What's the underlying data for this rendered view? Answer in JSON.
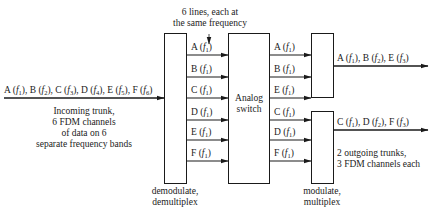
{
  "diagram": {
    "type": "block-diagram",
    "top_annotation": {
      "lines": [
        "6 lines, each at",
        "the same frequency"
      ]
    },
    "input": {
      "trunk_label": "A (f1), B (f2), C (f3), D (f4), E (f5), F (f6)",
      "channels": [
        {
          "name": "A",
          "freq": "1"
        },
        {
          "name": "B",
          "freq": "2"
        },
        {
          "name": "C",
          "freq": "3"
        },
        {
          "name": "D",
          "freq": "4"
        },
        {
          "name": "E",
          "freq": "5"
        },
        {
          "name": "F",
          "freq": "6"
        }
      ],
      "description": [
        "Incoming trunk,",
        "6 FDM channels",
        "of data on 6",
        "separate frequency bands"
      ]
    },
    "blocks": {
      "demux": {
        "caption": [
          "demodulate,",
          "demultiplex"
        ]
      },
      "switch": {
        "label": [
          "Analog",
          "switch"
        ]
      },
      "mux": {
        "caption": [
          "modulate,",
          "multiplex"
        ]
      }
    },
    "demux_outputs": [
      {
        "name": "A",
        "freq": "1"
      },
      {
        "name": "B",
        "freq": "1"
      },
      {
        "name": "C",
        "freq": "1"
      },
      {
        "name": "D",
        "freq": "1"
      },
      {
        "name": "E",
        "freq": "1"
      },
      {
        "name": "F",
        "freq": "1"
      }
    ],
    "switch_outputs": [
      {
        "name": "A",
        "freq": "1"
      },
      {
        "name": "B",
        "freq": "1"
      },
      {
        "name": "E",
        "freq": "1"
      },
      {
        "name": "C",
        "freq": "1"
      },
      {
        "name": "D",
        "freq": "1"
      },
      {
        "name": "F",
        "freq": "1"
      }
    ],
    "outputs": [
      {
        "label": "A (f1), B (f2), E (f3)",
        "channels": [
          {
            "name": "A",
            "freq": "1"
          },
          {
            "name": "B",
            "freq": "2"
          },
          {
            "name": "E",
            "freq": "3"
          }
        ]
      },
      {
        "label": "C (f1), D (f2), F (f3)",
        "channels": [
          {
            "name": "C",
            "freq": "1"
          },
          {
            "name": "D",
            "freq": "2"
          },
          {
            "name": "F",
            "freq": "3"
          }
        ]
      }
    ],
    "output_description": [
      "2 outgoing trunks,",
      "3 FDM channels each"
    ],
    "colors": {
      "line": "#1a1a1a",
      "text": "#222222",
      "background": "#ffffff"
    }
  }
}
